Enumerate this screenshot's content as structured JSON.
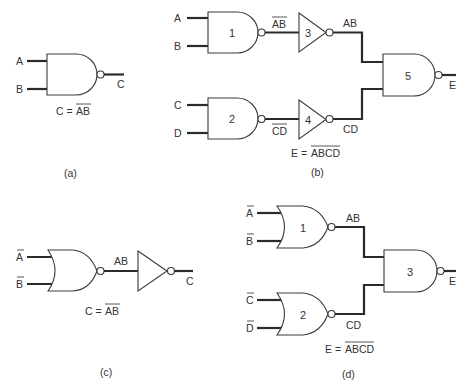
{
  "figure": {
    "panels": [
      {
        "id": "a",
        "caption": "(a)",
        "inputs": [
          "A",
          "B"
        ],
        "gates": [
          {
            "type": "NAND",
            "label": ""
          }
        ],
        "output": "C",
        "formula": {
          "lhs": "C =",
          "rhs": "AB",
          "rhs_overbar": true
        }
      },
      {
        "id": "b",
        "caption": "(b)",
        "inputs": [
          "A",
          "B",
          "C",
          "D"
        ],
        "gates": [
          {
            "type": "NAND",
            "label": "1"
          },
          {
            "type": "NAND",
            "label": "2"
          },
          {
            "type": "NOT",
            "label": "3"
          },
          {
            "type": "NOT",
            "label": "4"
          },
          {
            "type": "NAND",
            "label": "5"
          }
        ],
        "signals": {
          "g1_out": "AB",
          "g1_out_overbar": true,
          "g3_out": "AB",
          "g2_out": "CD",
          "g2_out_overbar": true,
          "g4_out": "CD"
        },
        "output": "E",
        "formula": {
          "lhs": "E =",
          "rhs": "ABCD",
          "rhs_overbar": true
        }
      },
      {
        "id": "c",
        "caption": "(c)",
        "inputs": [
          "A",
          "B"
        ],
        "inputs_overbar": true,
        "gates": [
          {
            "type": "NOR",
            "label": ""
          },
          {
            "type": "NOT",
            "label": ""
          }
        ],
        "signals": {
          "nor_out": "AB"
        },
        "output": "C",
        "formula": {
          "lhs": "C =",
          "rhs": "AB",
          "rhs_overbar": true
        }
      },
      {
        "id": "d",
        "caption": "(d)",
        "inputs": [
          "A",
          "B",
          "C",
          "D"
        ],
        "inputs_overbar": true,
        "gates": [
          {
            "type": "NOR",
            "label": "1"
          },
          {
            "type": "NOR",
            "label": "2"
          },
          {
            "type": "NAND",
            "label": "3"
          }
        ],
        "signals": {
          "g1_out": "AB",
          "g2_out": "CD"
        },
        "output": "E",
        "formula": {
          "lhs": "E =",
          "rhs": "ABCD",
          "rhs_overbar": true
        }
      }
    ]
  }
}
